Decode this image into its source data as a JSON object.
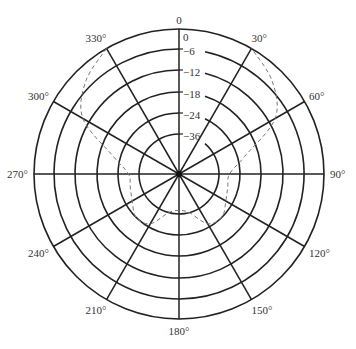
{
  "chart_data": {
    "type": "polar",
    "title": "",
    "center_label_top": "0",
    "angle_labels": [
      "0",
      "30°",
      "60°",
      "90°",
      "120°",
      "150°",
      "180°",
      "210°",
      "240°",
      "270°",
      "300°",
      "330°"
    ],
    "angles_deg": [
      0,
      30,
      60,
      90,
      120,
      150,
      180,
      210,
      240,
      270,
      300,
      330
    ],
    "radial_labels": [
      "0",
      "-6",
      "-12",
      "-18",
      "-24",
      "-36"
    ],
    "radial_values_db": [
      0,
      -6,
      -12,
      -18,
      -24,
      -36
    ],
    "grid": true,
    "series": [
      {
        "name": "radiation pattern",
        "style": "dashed",
        "points_deg_db": [
          [
            330,
            0
          ],
          [
            315,
            -4
          ],
          [
            300,
            -10
          ],
          [
            285,
            -22
          ],
          [
            270,
            -30
          ],
          [
            255,
            -30
          ],
          [
            240,
            -28
          ],
          [
            225,
            -24
          ],
          [
            210,
            -26
          ],
          [
            195,
            -36
          ],
          [
            180,
            -38
          ],
          [
            165,
            -36
          ],
          [
            150,
            -26
          ],
          [
            135,
            -24
          ],
          [
            120,
            -28
          ],
          [
            105,
            -30
          ],
          [
            90,
            -30
          ],
          [
            75,
            -22
          ],
          [
            60,
            -10
          ],
          [
            45,
            -4
          ],
          [
            30,
            0
          ]
        ]
      }
    ]
  }
}
